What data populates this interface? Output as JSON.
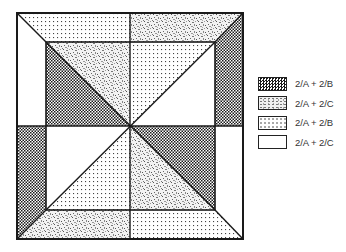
{
  "diagram": {
    "regions": [
      {
        "name": "top-band-left",
        "pattern": "dots"
      },
      {
        "name": "top-band-right",
        "pattern": "texture"
      },
      {
        "name": "right-band-top",
        "pattern": "checker"
      },
      {
        "name": "right-band-bottom",
        "pattern": "white"
      },
      {
        "name": "bottom-band-right",
        "pattern": "dots"
      },
      {
        "name": "bottom-band-left",
        "pattern": "texture"
      },
      {
        "name": "left-band-bottom",
        "pattern": "checker"
      },
      {
        "name": "left-band-top",
        "pattern": "white"
      },
      {
        "name": "inner-tl-lower",
        "pattern": "checker"
      },
      {
        "name": "inner-tl-upper",
        "pattern": "texture"
      },
      {
        "name": "inner-tr-upper",
        "pattern": "dots"
      },
      {
        "name": "inner-tr-lower",
        "pattern": "white"
      },
      {
        "name": "inner-bl-upper",
        "pattern": "white"
      },
      {
        "name": "inner-bl-lower",
        "pattern": "dots"
      },
      {
        "name": "inner-br-upper",
        "pattern": "checker"
      },
      {
        "name": "inner-br-lower",
        "pattern": "texture"
      }
    ]
  },
  "legend": {
    "items": [
      {
        "pattern": "checker",
        "label": "2/A + 2/B"
      },
      {
        "pattern": "texture",
        "label": "2/A + 2/C"
      },
      {
        "pattern": "dots",
        "label": "2/A + 2/B"
      },
      {
        "pattern": "white",
        "label": "2/A + 2/C"
      }
    ]
  }
}
